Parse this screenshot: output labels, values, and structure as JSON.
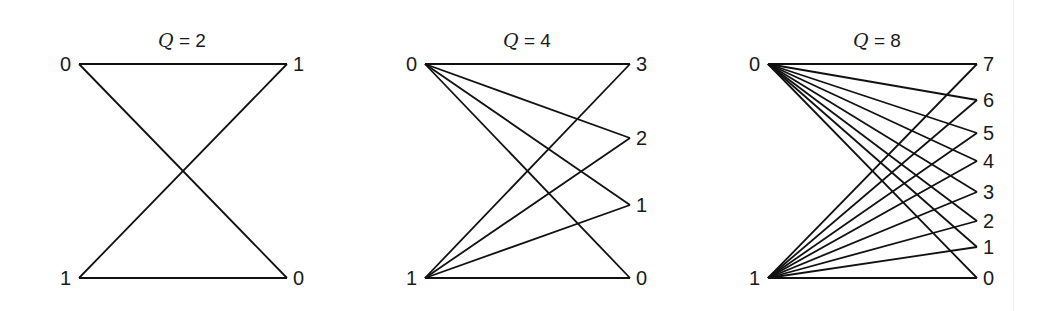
{
  "figure": {
    "background": "#ffffff",
    "line_color": "#111111",
    "panels": [
      {
        "id": "q2",
        "title_var": "Q",
        "title_rest": " = 2",
        "title_x": 182,
        "title_y": 47,
        "left_x": 79,
        "right_x": 287,
        "left_nodes": [
          {
            "label": "0",
            "y": 64
          },
          {
            "label": "1",
            "y": 278
          }
        ],
        "right_nodes": [
          {
            "label": "1",
            "y": 64
          },
          {
            "label": "0",
            "y": 278
          }
        ],
        "edges": [
          [
            "0",
            "1"
          ],
          [
            "0",
            "0"
          ],
          [
            "1",
            "1"
          ],
          [
            "1",
            "0"
          ]
        ]
      },
      {
        "id": "q4",
        "title_var": "Q",
        "title_rest": " = 4",
        "title_x": 527,
        "title_y": 47,
        "left_x": 425,
        "right_x": 630,
        "left_nodes": [
          {
            "label": "0",
            "y": 64
          },
          {
            "label": "1",
            "y": 278
          }
        ],
        "right_nodes": [
          {
            "label": "3",
            "y": 64
          },
          {
            "label": "2",
            "y": 138
          },
          {
            "label": "1",
            "y": 205
          },
          {
            "label": "0",
            "y": 278
          }
        ],
        "edges": [
          [
            "0",
            "3"
          ],
          [
            "0",
            "2"
          ],
          [
            "0",
            "1"
          ],
          [
            "0",
            "0"
          ],
          [
            "1",
            "3"
          ],
          [
            "1",
            "2"
          ],
          [
            "1",
            "1"
          ],
          [
            "1",
            "0"
          ]
        ]
      },
      {
        "id": "q8",
        "title_var": "Q",
        "title_rest": " = 8",
        "title_x": 877,
        "title_y": 47,
        "left_x": 768,
        "right_x": 977,
        "left_nodes": [
          {
            "label": "0",
            "y": 64
          },
          {
            "label": "1",
            "y": 278
          }
        ],
        "right_nodes": [
          {
            "label": "7",
            "y": 64
          },
          {
            "label": "6",
            "y": 100
          },
          {
            "label": "5",
            "y": 133
          },
          {
            "label": "4",
            "y": 161
          },
          {
            "label": "3",
            "y": 192
          },
          {
            "label": "2",
            "y": 221
          },
          {
            "label": "1",
            "y": 247
          },
          {
            "label": "0",
            "y": 278
          }
        ],
        "edges": [
          [
            "0",
            "7"
          ],
          [
            "0",
            "6"
          ],
          [
            "0",
            "5"
          ],
          [
            "0",
            "4"
          ],
          [
            "0",
            "3"
          ],
          [
            "0",
            "2"
          ],
          [
            "0",
            "1"
          ],
          [
            "0",
            "0"
          ],
          [
            "1",
            "7"
          ],
          [
            "1",
            "6"
          ],
          [
            "1",
            "5"
          ],
          [
            "1",
            "4"
          ],
          [
            "1",
            "3"
          ],
          [
            "1",
            "2"
          ],
          [
            "1",
            "1"
          ],
          [
            "1",
            "0"
          ]
        ]
      }
    ]
  }
}
